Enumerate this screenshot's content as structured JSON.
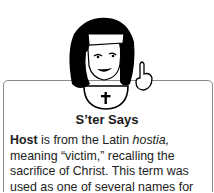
{
  "sidebar_box": {
    "title": "S’ter Says",
    "term": "Host",
    "text_1": " is from the Latin ",
    "latin": "hostia,",
    "text_2": " meaning “victim,” recalling the sacrifice of Christ. This term was used as one of several names for"
  },
  "illustration": {
    "icon": "nun-pointing-icon"
  }
}
